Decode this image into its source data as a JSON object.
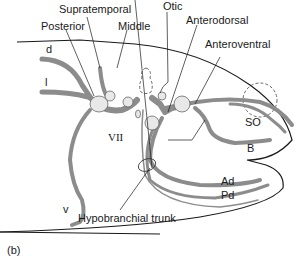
{
  "figure": {
    "panel_label": "(b)",
    "colors": {
      "nerve": "#8c8c8c",
      "outline": "#1a1a1a",
      "ganglion_fill": "#e8e8e8"
    }
  },
  "labels": {
    "supratemporal": "Supratemporal",
    "posterior": "Posterior",
    "middle": "Middle",
    "otic": "Otic",
    "anterodorsal": "Anterodorsal",
    "anteroventral": "Anteroventral",
    "d": "d",
    "l": "l",
    "v": "v",
    "vii": "VII",
    "so": "SO",
    "b": "B",
    "ad": "Ad",
    "pd": "Pd",
    "hypobranchial_trunk": "Hypobranchial trunk"
  }
}
